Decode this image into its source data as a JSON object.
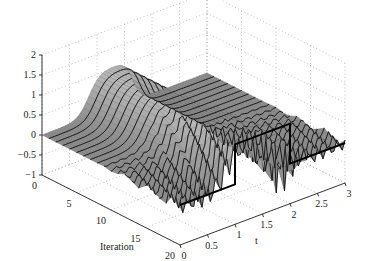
{
  "chart_data": {
    "type": "surface3d",
    "title": "",
    "xlabel": "t",
    "ylabel": "Iteration",
    "zlabel": "",
    "xlim": [
      0,
      3
    ],
    "ylim": [
      0,
      20
    ],
    "zlim": [
      -1,
      2
    ],
    "x_ticks": [
      "0",
      "0.5",
      "1",
      "1.5",
      "2",
      "2.5",
      "3"
    ],
    "y_ticks": [
      "0",
      "5",
      "10",
      "15",
      "20"
    ],
    "z_ticks": [
      "2",
      "1.5",
      "1",
      "0.5",
      "0",
      "-0.5",
      "-1"
    ],
    "grid": true,
    "series": [
      {
        "name": "reference",
        "t": [
          0,
          1,
          1,
          2,
          2,
          3
        ],
        "z": [
          0,
          0,
          1,
          1,
          0,
          0
        ]
      }
    ]
  },
  "axes": {
    "x_label": "t",
    "y_label": "Iteration"
  }
}
